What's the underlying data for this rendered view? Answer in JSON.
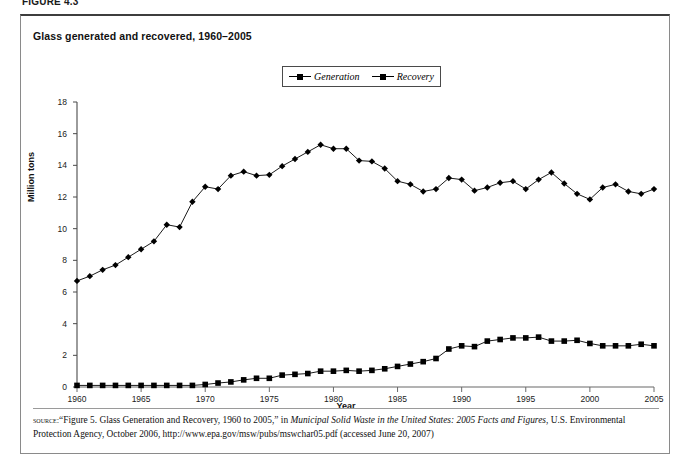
{
  "figure_label": "FIGURE 4.3",
  "chart_title": "Glass generated and recovered, 1960–2005",
  "legend": {
    "position": "top-center",
    "entries": [
      {
        "label": "Generation",
        "marker": "diamond",
        "color": "#000000"
      },
      {
        "label": "Recovery",
        "marker": "square",
        "color": "#000000"
      }
    ]
  },
  "source": {
    "keyword": "source:",
    "text_part1": "“Figure 5. Glass Generation and Recovery, 1960 to 2005,” in ",
    "italic_part": "Municipal Solid Waste in the United States: 2005 Facts and Figures",
    "text_part2": ", U.S. Environmental Protection Agency, October 2006, http://www.epa.gov/msw/pubs/mswchar05.pdf (accessed June 20, 2007)"
  },
  "chart_data": {
    "type": "line",
    "title": "Glass generated and recovered, 1960–2005",
    "xlabel": "Year",
    "ylabel": "Million tons",
    "xlim": [
      1960,
      2005
    ],
    "ylim": [
      0,
      18
    ],
    "ytick_step": 2,
    "yticks": [
      0,
      2,
      4,
      6,
      8,
      10,
      12,
      14,
      16,
      18
    ],
    "xticks": [
      1960,
      1965,
      1970,
      1975,
      1980,
      1985,
      1990,
      1995,
      2000,
      2005
    ],
    "grid": false,
    "legend_position": "top-center",
    "x": [
      1960,
      1961,
      1962,
      1963,
      1964,
      1965,
      1966,
      1967,
      1968,
      1969,
      1970,
      1971,
      1972,
      1973,
      1974,
      1975,
      1976,
      1977,
      1978,
      1979,
      1980,
      1981,
      1982,
      1983,
      1984,
      1985,
      1986,
      1987,
      1988,
      1989,
      1990,
      1991,
      1992,
      1993,
      1994,
      1995,
      1996,
      1997,
      1998,
      1999,
      2000,
      2001,
      2002,
      2003,
      2004,
      2005
    ],
    "series": [
      {
        "name": "Generation",
        "marker": "diamond",
        "color": "#000000",
        "values": [
          6.7,
          7.0,
          7.4,
          7.7,
          8.2,
          8.7,
          9.2,
          10.25,
          10.1,
          11.7,
          12.65,
          12.5,
          13.35,
          13.6,
          13.35,
          13.4,
          13.95,
          14.4,
          14.85,
          15.3,
          15.05,
          15.05,
          14.3,
          14.25,
          13.8,
          13.0,
          12.8,
          12.35,
          12.5,
          13.2,
          13.1,
          12.4,
          12.6,
          12.9,
          13.0,
          12.5,
          13.1,
          13.55,
          12.85,
          12.2,
          11.85,
          12.6,
          12.8,
          12.35,
          12.2,
          12.5
        ]
      },
      {
        "name": "Recovery",
        "marker": "square",
        "color": "#000000",
        "values": [
          0.1,
          0.1,
          0.1,
          0.1,
          0.1,
          0.1,
          0.1,
          0.1,
          0.1,
          0.1,
          0.16,
          0.25,
          0.32,
          0.45,
          0.55,
          0.55,
          0.75,
          0.8,
          0.85,
          1.0,
          1.0,
          1.05,
          1.0,
          1.05,
          1.15,
          1.3,
          1.45,
          1.6,
          1.8,
          2.4,
          2.6,
          2.55,
          2.9,
          3.0,
          3.1,
          3.1,
          3.15,
          2.9,
          2.9,
          2.95,
          2.75,
          2.6,
          2.6,
          2.6,
          2.7,
          2.6
        ]
      }
    ]
  }
}
